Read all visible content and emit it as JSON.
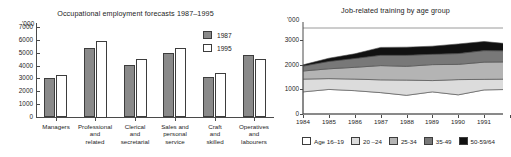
{
  "charts": {
    "bar": {
      "title": "Occupational employment forecasts 1987–1995",
      "unit_label": "'000"
    },
    "area": {
      "title": "Job-related training by age group",
      "unit_label": "'000"
    }
  },
  "chart_data": [
    {
      "type": "bar",
      "title": "Occupational employment forecasts 1987–1995",
      "xlabel": "",
      "ylabel": "'000",
      "ylim": [
        0,
        7000
      ],
      "ytick_labels": [
        "0",
        "1000",
        "2000",
        "3000",
        "4000",
        "5000",
        "6000",
        "7000"
      ],
      "ytick_values": [
        0,
        1000,
        2000,
        3000,
        4000,
        5000,
        6000,
        7000
      ],
      "grid": false,
      "legend_position": "top-right",
      "categories": [
        "Managers",
        "Professional and related",
        "Clerical and secretarial",
        "Sales and personal service",
        "Craft and skilled",
        "Operatives and labourers"
      ],
      "category_lines": [
        [
          "Managers"
        ],
        [
          "Professional",
          "and",
          "related"
        ],
        [
          "Clerical",
          "and",
          "secretarial"
        ],
        [
          "Sales and",
          "personal",
          "service"
        ],
        [
          "Craft",
          "and",
          "skilled"
        ],
        [
          "Operatives",
          "and",
          "labourers"
        ]
      ],
      "series": [
        {
          "name": "1987",
          "color": "#8a8a8a",
          "values": [
            3000,
            5400,
            4050,
            4950,
            3100,
            4800
          ]
        },
        {
          "name": "1995",
          "color": "#ffffff",
          "values": [
            3300,
            5950,
            4500,
            5350,
            3400,
            4500
          ]
        }
      ]
    },
    {
      "type": "area",
      "title": "Job-related training by age group",
      "xlabel": "",
      "ylabel": "'000",
      "ylim": [
        0,
        3500
      ],
      "ytick_labels": [
        "0",
        "1000",
        "2000",
        "3000"
      ],
      "ytick_values": [
        0,
        1000,
        2000,
        3000
      ],
      "grid": true,
      "stacked": true,
      "legend_position": "bottom",
      "x": [
        1984,
        1985,
        1986,
        1987,
        1988,
        1989,
        1990,
        1991,
        1992
      ],
      "xtick_labels": [
        "1984",
        "1985",
        "1986",
        "1987",
        "1988",
        "1989",
        "1990",
        "1991"
      ],
      "series": [
        {
          "name": "Age 16–19",
          "color": "#ffffff",
          "values": [
            900,
            1000,
            950,
            870,
            760,
            900,
            780,
            980,
            1000
          ]
        },
        {
          "name": "20 –24",
          "color": "#dcdcdc",
          "values": [
            520,
            440,
            470,
            520,
            620,
            460,
            620,
            430,
            420
          ]
        },
        {
          "name": "25-34",
          "color": "#b4b4b4",
          "values": [
            330,
            400,
            480,
            580,
            560,
            650,
            620,
            700,
            700
          ]
        },
        {
          "name": "35-49",
          "color": "#787878",
          "values": [
            200,
            300,
            360,
            420,
            450,
            420,
            440,
            470,
            450
          ]
        },
        {
          "name": "50-59/64",
          "color": "#111111",
          "values": [
            50,
            130,
            190,
            320,
            330,
            330,
            390,
            370,
            280
          ]
        }
      ]
    }
  ]
}
